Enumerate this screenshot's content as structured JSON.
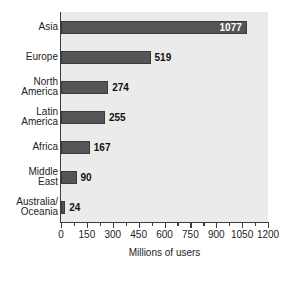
{
  "chart_data": {
    "type": "bar",
    "orientation": "horizontal",
    "title": "",
    "xlabel": "Millions of users",
    "ylabel": "",
    "xlim": [
      0,
      1200
    ],
    "xticks": [
      0,
      150,
      300,
      450,
      600,
      750,
      900,
      1050,
      1200
    ],
    "xtick_labels": [
      "0",
      "150",
      "300",
      "450",
      "600",
      "750",
      "900",
      "1050",
      "1200"
    ],
    "minor_tick_step": 75,
    "grid": false,
    "legend": null,
    "categories": [
      "Asia",
      "Europe",
      "North\nAmerica",
      "Latin\nAmerica",
      "Africa",
      "Middle\nEast",
      "Australia/\nOceania"
    ],
    "values": [
      1077,
      519,
      274,
      255,
      167,
      90,
      24
    ],
    "value_labels": [
      "1077",
      "519",
      "274",
      "255",
      "167",
      "90",
      "24"
    ],
    "label_placement": [
      "inside",
      "outside",
      "outside",
      "outside",
      "outside",
      "outside",
      "outside"
    ],
    "colors": {
      "bar_fill": "#555557",
      "bar_outline": "#3a3a3c",
      "plot_background": "#ebebeb",
      "page_background": "#ffffff",
      "axis": "#3d3d3d",
      "text": "#1d1d1d",
      "inside_label_text": "#ffffff"
    }
  }
}
